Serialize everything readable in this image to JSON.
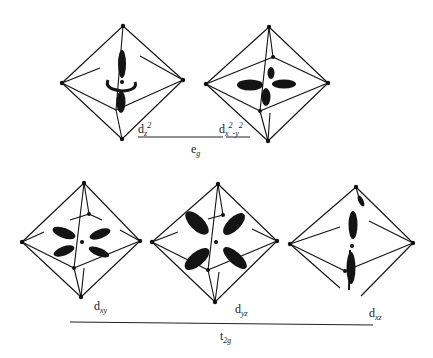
{
  "figure": {
    "groups": [
      {
        "name": "eg",
        "label_main": "e",
        "label_sub": "g",
        "members": [
          "dz2",
          "dx2-y2"
        ]
      },
      {
        "name": "t2g",
        "label_main": "t",
        "label_sub": "2g",
        "members": [
          "dxy",
          "dyz",
          "dxz"
        ]
      }
    ],
    "orbitals": [
      {
        "id": "dz2",
        "label_main": "d",
        "label_sub": "z",
        "label_sup": "2"
      },
      {
        "id": "dx2-y2",
        "label_main": "d",
        "label_sub": "x",
        "label_sup": "2",
        "label_tail": "-y",
        "label_tail_sup": "2"
      },
      {
        "id": "dxy",
        "label_main": "d",
        "label_sub": "xy"
      },
      {
        "id": "dyz",
        "label_main": "d",
        "label_sub": "yz"
      },
      {
        "id": "dxz",
        "label_main": "d",
        "label_sub": "xz"
      }
    ],
    "colors": {
      "ink": "#111111",
      "background": "#ffffff"
    }
  }
}
